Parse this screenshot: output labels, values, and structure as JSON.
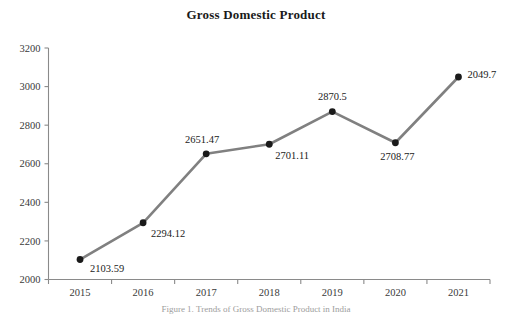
{
  "chart_data": {
    "type": "line",
    "title": "Gross Domestic Product",
    "xlabel": "",
    "ylabel": "",
    "categories": [
      "2015",
      "2016",
      "2017",
      "2018",
      "2019",
      "2020",
      "2021"
    ],
    "values": [
      2103.59,
      2294.12,
      2651.47,
      2701.11,
      2870.5,
      2708.77,
      3049.7
    ],
    "point_labels": [
      "2103.59",
      "2294.12",
      "2651.47",
      "2701.11",
      "2870.5",
      "2708.77",
      "2049.7"
    ],
    "ylim": [
      2000,
      3200
    ],
    "yticks": [
      "2000",
      "2200",
      "2400",
      "2600",
      "2800",
      "3000",
      "3200"
    ],
    "ytick_values": [
      2000,
      2200,
      2400,
      2600,
      2800,
      3000,
      3200
    ],
    "xticks": [
      "2015",
      "2016",
      "2017",
      "2018",
      "2019",
      "2020",
      "2021"
    ],
    "grid": false,
    "legend": false,
    "series": [
      {
        "name": "Gross Domestic Product",
        "values": [
          2103.59,
          2294.12,
          2651.47,
          2701.11,
          2870.5,
          2708.77,
          3049.7
        ],
        "line_color": "#808080",
        "marker_color": "#1a1a1a"
      }
    ],
    "label_offsets": [
      {
        "dx": 10,
        "dy": 12,
        "anchor": "start"
      },
      {
        "dx": 8,
        "dy": 14,
        "anchor": "start"
      },
      {
        "dx": -4,
        "dy": -11,
        "anchor": "middle"
      },
      {
        "dx": 6,
        "dy": 15,
        "anchor": "start"
      },
      {
        "dx": 0,
        "dy": -12,
        "anchor": "middle"
      },
      {
        "dx": 2,
        "dy": 17,
        "anchor": "middle"
      },
      {
        "dx": 9,
        "dy": 1,
        "anchor": "start"
      }
    ]
  },
  "caption": {
    "text": "Figure 1. Trends of Gross Domestic Product in India"
  },
  "colors": {
    "line": "#808080",
    "marker": "#1a1a1a",
    "axis": "#8a8a8a",
    "text": "#222222",
    "tick_text": "#3a3a3a",
    "background": "#ffffff"
  }
}
